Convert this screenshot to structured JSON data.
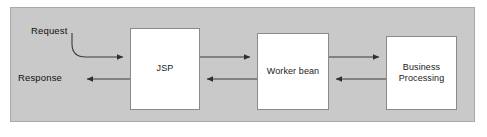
{
  "diagram": {
    "panel": {
      "background_color": "#c9c9c9",
      "border_color": "#a9a9a9"
    },
    "node_style": {
      "fill_color": "#ffffff",
      "border_color": "#8a8a8a",
      "text_color": "#1a1a1a"
    },
    "connector_color": "#3a3a3a",
    "nodes": [
      {
        "id": "jsp",
        "label": "JSP"
      },
      {
        "id": "worker",
        "label": "Worker bean"
      },
      {
        "id": "business",
        "label": "Business\nProcessing"
      }
    ],
    "edge_labels": [
      {
        "id": "request",
        "label": "Request"
      },
      {
        "id": "response",
        "label": "Response"
      }
    ],
    "connectors": [
      {
        "id": "request-to-jsp",
        "from": "Request",
        "to": "JSP",
        "direction": "right",
        "shape": "curved"
      },
      {
        "id": "jsp-to-response",
        "from": "JSP",
        "to": "Response",
        "direction": "left",
        "shape": "straight"
      },
      {
        "id": "jsp-to-worker",
        "from": "JSP",
        "to": "Worker bean",
        "direction": "right",
        "shape": "straight"
      },
      {
        "id": "worker-to-jsp",
        "from": "Worker bean",
        "to": "JSP",
        "direction": "left",
        "shape": "straight"
      },
      {
        "id": "worker-to-business",
        "from": "Worker bean",
        "to": "Business Processing",
        "direction": "right",
        "shape": "straight"
      },
      {
        "id": "business-to-worker",
        "from": "Business Processing",
        "to": "Worker bean",
        "direction": "left",
        "shape": "straight"
      }
    ]
  }
}
